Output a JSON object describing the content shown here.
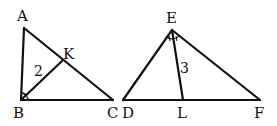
{
  "diagram": {
    "triangle_1": {
      "vertices": [
        "A",
        "B",
        "C"
      ],
      "cevian": {
        "from": "B",
        "to": "K",
        "type": "angle-bisector",
        "length_label": "2"
      },
      "labels": {
        "A": "A",
        "B": "B",
        "C": "C",
        "K": "K"
      },
      "angle_mark_at": "B"
    },
    "triangle_2": {
      "vertices": [
        "D",
        "E",
        "F"
      ],
      "cevian": {
        "from": "E",
        "to": "L",
        "type": "angle-bisector",
        "length_label": "3"
      },
      "labels": {
        "D": "D",
        "E": "E",
        "F": "F",
        "L": "L"
      },
      "angle_mark_at": "E"
    },
    "stroke_color": "#111111",
    "background": "#ffffff"
  }
}
